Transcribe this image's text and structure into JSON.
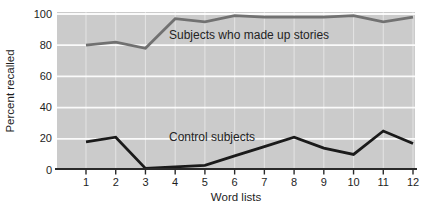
{
  "chart_data": {
    "type": "line",
    "title": "",
    "xlabel": "Word lists",
    "ylabel": "Percent recalled",
    "x": [
      1,
      2,
      3,
      4,
      5,
      6,
      7,
      8,
      9,
      10,
      11,
      12
    ],
    "yticks": [
      0,
      20,
      40,
      60,
      80,
      100
    ],
    "ylim": [
      0,
      100
    ],
    "grid": "white horizontal and vertical gridlines on gray panel",
    "legend_position": "labels drawn inside plot next to lines",
    "series": [
      {
        "name": "Subjects who made up stories",
        "color": "#717171",
        "values": [
          80,
          82,
          78,
          97,
          95,
          99,
          98,
          98,
          98,
          99,
          95,
          98
        ]
      },
      {
        "name": "Control subjects",
        "color": "#1a1a1a",
        "values": [
          18,
          21,
          1,
          2,
          3,
          9,
          15,
          21,
          14,
          10,
          25,
          17
        ]
      }
    ]
  },
  "colors": {
    "panel_background": "#cbcbcb",
    "page_background": "#ffffff",
    "grid_horizontal": "#ffffff",
    "grid_vertical": "#ffffff",
    "axis_line": "#2a2a2a",
    "text": "#1d1d1d"
  }
}
